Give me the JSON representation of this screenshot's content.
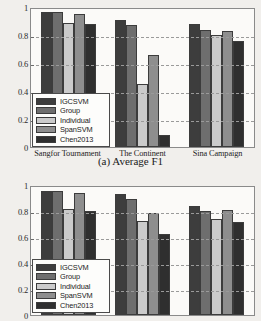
{
  "figure": {
    "caption_a": "(a) Average F1"
  },
  "legend": {
    "entries": [
      {
        "label": "IGCSVM",
        "color": "#3d3d3d"
      },
      {
        "label": "Group",
        "color": "#6e6e6e"
      },
      {
        "label": "Individual",
        "color": "#cbcbcb"
      },
      {
        "label": "SpanSVM",
        "color": "#8e8e8e"
      },
      {
        "label": "Chen2013",
        "color": "#2f2f2f"
      }
    ]
  },
  "chart_data": [
    {
      "id": "chart-a",
      "type": "bar",
      "title": "(a) Average F1",
      "xlabel": "",
      "ylabel": "",
      "ylim": [
        0,
        1
      ],
      "yticks": [
        "0",
        "0.2",
        "0.4",
        "0.6",
        "0.8",
        "1"
      ],
      "ytick_values": [
        0,
        0.2,
        0.4,
        0.6,
        0.8,
        1
      ],
      "grid": true,
      "legend_position": "lower-left",
      "categories": [
        "Sangfor Tournament",
        "The Continent",
        "Sina Campaign"
      ],
      "series": [
        {
          "name": "IGCSVM",
          "color": "#3d3d3d",
          "values": [
            0.98,
            0.92,
            0.89
          ]
        },
        {
          "name": "Group",
          "color": "#6e6e6e",
          "values": [
            0.98,
            0.885,
            0.85
          ]
        },
        {
          "name": "Individual",
          "color": "#cbcbcb",
          "values": [
            0.9,
            0.455,
            0.815
          ]
        },
        {
          "name": "SpanSVM",
          "color": "#8e8e8e",
          "values": [
            0.965,
            0.665,
            0.84
          ]
        },
        {
          "name": "Chen2013",
          "color": "#2f2f2f",
          "values": [
            0.89,
            0.085,
            0.77
          ]
        }
      ]
    },
    {
      "id": "chart-b",
      "type": "bar",
      "title": "",
      "xlabel": "",
      "ylabel": "",
      "ylim": [
        0,
        1
      ],
      "yticks": [
        "0",
        "0.2",
        "0.4",
        "0.6",
        "0.8",
        "1"
      ],
      "ytick_values": [
        0,
        0.2,
        0.4,
        0.6,
        0.8,
        1
      ],
      "grid": true,
      "legend_position": "lower-left",
      "categories": [
        "",
        "",
        ""
      ],
      "series": [
        {
          "name": "IGCSVM",
          "color": "#3d3d3d",
          "values": [
            0.965,
            0.945,
            0.855
          ]
        },
        {
          "name": "Group",
          "color": "#6e6e6e",
          "values": [
            0.965,
            0.91,
            0.81
          ]
        },
        {
          "name": "Individual",
          "color": "#cbcbcb",
          "values": [
            0.83,
            0.735,
            0.75
          ]
        },
        {
          "name": "SpanSVM",
          "color": "#8e8e8e",
          "values": [
            0.955,
            0.8,
            0.82
          ]
        },
        {
          "name": "Chen2013",
          "color": "#2f2f2f",
          "values": [
            0.81,
            0.635,
            0.725
          ]
        }
      ]
    }
  ]
}
